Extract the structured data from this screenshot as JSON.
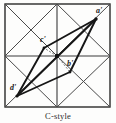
{
  "figure": {
    "caption": "C-style",
    "frame": {
      "x": 5,
      "y": 4,
      "width": 105,
      "height": 103
    },
    "colors": {
      "ink": "#2a2a2a",
      "thin_line": "#4a4a4a",
      "thick_line": "#1a1a1a",
      "background": "#fdfdfc"
    },
    "labels": [
      {
        "name": "a-prime",
        "text": "a'",
        "x": 97,
        "y": 11
      },
      {
        "name": "c-prime",
        "text": "c'",
        "x": 41,
        "y": 40
      },
      {
        "name": "b-prime",
        "text": "b'",
        "x": 67,
        "y": 64
      },
      {
        "name": "d-prime",
        "text": "d'",
        "x": 11,
        "y": 88
      }
    ],
    "points": {
      "a_prime": {
        "x": 96,
        "y": 19
      },
      "c_prime": {
        "x": 44,
        "y": 48
      },
      "b_prime": {
        "x": 70,
        "y": 72
      },
      "d_prime": {
        "x": 17,
        "y": 96
      },
      "center": {
        "x": 57,
        "y": 56
      }
    },
    "grid": {
      "columns": 2,
      "rows": 2,
      "midline_vertical_x": 57,
      "midline_horizontal_y": 56,
      "diagonals_per_cell": 2
    },
    "thick_path": [
      "a_prime",
      "c_prime",
      "d_prime",
      "b_prime",
      "a_prime"
    ],
    "leader_lines": [
      {
        "from": "center",
        "to": "c_prime",
        "style": "dashed"
      },
      {
        "from": "center",
        "to": "b_prime",
        "style": "dashed"
      }
    ]
  }
}
